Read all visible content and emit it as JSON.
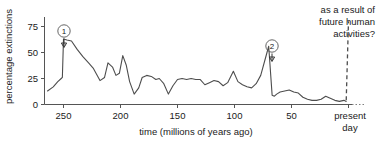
{
  "chart_data": {
    "type": "line",
    "title": "",
    "xlabel": "time (millions of years ago)",
    "ylabel": "percentage extinctions",
    "xlim": [
      265,
      0
    ],
    "ylim": [
      0,
      85
    ],
    "x_ticks": [
      250,
      200,
      150,
      100,
      50
    ],
    "x_tick_labels": [
      "250",
      "200",
      "150",
      "100",
      "50"
    ],
    "x_end_label_line1": "present",
    "x_end_label_line2": "day",
    "y_ticks": [
      0,
      25,
      50,
      75
    ],
    "y_tick_labels": [
      "0",
      "25",
      "50",
      "75"
    ],
    "grid": false,
    "legend": "none",
    "x_axis_direction": "reversed",
    "series": [
      {
        "name": "percentage extinctions",
        "style": "solid",
        "x": [
          264,
          259,
          255,
          252,
          251,
          250,
          247,
          243,
          238,
          233,
          228,
          224,
          221,
          218,
          214,
          211,
          207,
          204,
          201,
          198,
          195,
          192,
          188,
          184,
          181,
          177,
          173,
          169,
          166,
          162,
          158,
          154,
          150,
          146,
          142,
          138,
          134,
          130,
          126,
          122,
          118,
          114,
          110,
          106,
          101,
          97,
          93,
          89,
          85,
          81,
          77,
          73,
          70,
          67,
          65,
          63,
          60,
          56,
          52,
          48,
          44,
          40,
          36,
          32,
          28,
          24,
          20,
          16,
          12,
          8,
          4,
          2
        ],
        "y": [
          13,
          17,
          22,
          25,
          26,
          63,
          62,
          61,
          53,
          46,
          40,
          35,
          29,
          23,
          26,
          40,
          36,
          28,
          30,
          47,
          38,
          22,
          10,
          16,
          26,
          28,
          27,
          24,
          25,
          20,
          10,
          18,
          24,
          25,
          24,
          25,
          24,
          24,
          19,
          21,
          23,
          22,
          18,
          21,
          32,
          22,
          19,
          17,
          16,
          20,
          28,
          44,
          56,
          9,
          8,
          10,
          12,
          13,
          14,
          12,
          11,
          7,
          5,
          4,
          4,
          5,
          8,
          6,
          4,
          3,
          4,
          3
        ]
      },
      {
        "name": "future projection",
        "style": "dashed",
        "x": [
          2,
          0
        ],
        "y": [
          4,
          80
        ]
      }
    ],
    "annotations": [
      {
        "id": "1",
        "label": "1",
        "shape": "circled-number-with-arrow",
        "x": 250,
        "y": 63,
        "description": "Permian mass extinction peak marker"
      },
      {
        "id": "2",
        "label": "2",
        "shape": "circled-number-with-arrow",
        "x": 66,
        "y": 56,
        "description": "Cretaceous mass extinction peak marker"
      },
      {
        "id": "future",
        "lines": [
          "as a result of",
          "future human",
          "activities?"
        ],
        "align": "right",
        "description": "Text annotation above dashed future projection line"
      }
    ]
  },
  "colors": {
    "line": "#4d4d4d",
    "axis": "#555555",
    "text": "#1a1a1a",
    "background": "#ffffff"
  }
}
